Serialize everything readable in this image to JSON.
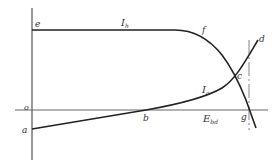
{
  "diagram": {
    "type": "current-voltage characteristic",
    "point_labels": {
      "e": "e",
      "f": "f",
      "c": "c",
      "d": "d",
      "o": "o",
      "a": "a",
      "b": "b",
      "g": "g"
    },
    "curve_labels": {
      "Ih_main": "I",
      "Ih_sub": "h",
      "Ia_main": "I",
      "Ia_sub": "a"
    },
    "axis_labels": {
      "Ebd_main": "E",
      "Ebd_sub": "bd"
    },
    "colors": {
      "curve": "#222222",
      "axis": "#555555",
      "text": "#333333"
    }
  }
}
